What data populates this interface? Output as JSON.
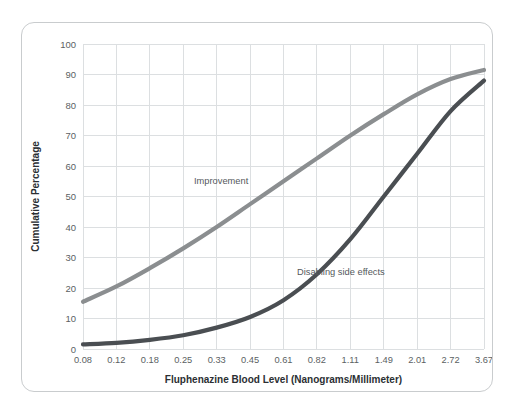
{
  "chart_data": {
    "type": "line",
    "title": "",
    "xlabel": "Fluphenazine Blood Level (Nanograms/Millimeter)",
    "ylabel": "Cumulative Percentage",
    "grid": true,
    "legend_position": "inline-annotations",
    "xscale": "log-spaced-categorical",
    "categories": [
      "0.08",
      "0.12",
      "0.18",
      "0.25",
      "0.33",
      "0.45",
      "0.61",
      "0.82",
      "1.11",
      "1.49",
      "2.01",
      "2.72",
      "3.67"
    ],
    "x": [
      0.08,
      0.12,
      0.18,
      0.25,
      0.33,
      0.45,
      0.61,
      0.82,
      1.11,
      1.49,
      2.01,
      2.72,
      3.67
    ],
    "ylim": [
      0,
      100
    ],
    "yticks": [
      0,
      10,
      20,
      30,
      40,
      50,
      60,
      70,
      80,
      90,
      100
    ],
    "ytick_labels": [
      "0",
      "10",
      "20",
      "30",
      "40",
      "50",
      "60",
      "70",
      "80",
      "90",
      "100"
    ],
    "series": [
      {
        "name": "Improvement",
        "color": "#8b8e90",
        "values": [
          15.5,
          20.5,
          26.5,
          33.0,
          40.0,
          47.5,
          55.0,
          62.5,
          70.0,
          77.0,
          83.5,
          88.5,
          91.5
        ]
      },
      {
        "name": "Disabling side effects",
        "color": "#4a4e52",
        "values": [
          1.5,
          2.0,
          3.0,
          4.5,
          7.0,
          10.5,
          16.0,
          24.5,
          36.0,
          50.0,
          64.0,
          78.0,
          88.0
        ]
      }
    ],
    "annotations": [
      {
        "text": "Improvement",
        "series": "Improvement",
        "x_px": 193,
        "y_px": 180
      },
      {
        "text": "Disabling side effects",
        "series": "Disabling side effects",
        "x_px": 296,
        "y_px": 273
      }
    ],
    "colors": {
      "improvement_line": "#8b8e90",
      "side_effects_line": "#4a4e52",
      "gridline": "#dcdfe1",
      "axis_text": "#5b5f63",
      "card_border": "#c9ccce",
      "background": "#ffffff"
    }
  }
}
